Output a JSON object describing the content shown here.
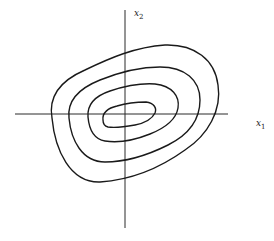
{
  "diagram": {
    "type": "contour-plot",
    "axes": {
      "x_label": "x",
      "x_subscript": "1",
      "y_label": "x",
      "y_subscript": "2"
    },
    "contours": {
      "count": 4,
      "shape": "nested tilted ovals centered at origin, major axis tilted up-right"
    },
    "colors": {
      "line": "#1a1a1a",
      "background": "#ffffff"
    }
  }
}
